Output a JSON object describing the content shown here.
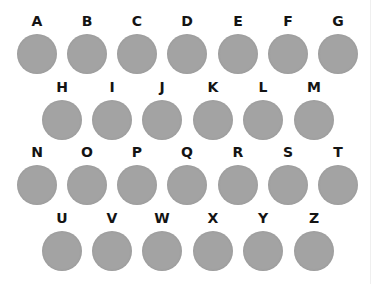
{
  "colors": {
    "circle": "#a3a3a3",
    "label": "#141414",
    "background": "#ffffff"
  },
  "rows": [
    {
      "letters": [
        "A",
        "B",
        "C",
        "D",
        "E",
        "F",
        "G"
      ]
    },
    {
      "letters": [
        "H",
        "I",
        "J",
        "K",
        "L",
        "M"
      ]
    },
    {
      "letters": [
        "N",
        "O",
        "P",
        "Q",
        "R",
        "S",
        "T"
      ]
    },
    {
      "letters": [
        "U",
        "V",
        "W",
        "X",
        "Y",
        "Z"
      ]
    }
  ]
}
